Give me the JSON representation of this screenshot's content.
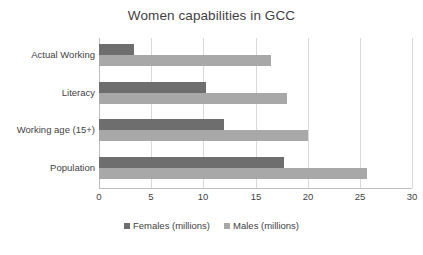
{
  "chart_data": {
    "type": "bar",
    "orientation": "horizontal",
    "title": "Women capabilities in GCC",
    "xlabel": "",
    "ylabel": "",
    "xlim": [
      0,
      30
    ],
    "xticks": [
      0,
      5,
      10,
      15,
      20,
      25,
      30
    ],
    "xtick_labels": [
      "0",
      "5",
      "10",
      "15",
      "20",
      "25",
      "30"
    ],
    "grid": true,
    "grid_axis": "x",
    "legend_position": "bottom",
    "categories": [
      "Actual Working",
      "Literacy",
      "Working age (15+)",
      "Population"
    ],
    "series": [
      {
        "name": "Females (millions)",
        "color": "#6e6e6e",
        "values": [
          3.4,
          10.3,
          12.0,
          17.7
        ]
      },
      {
        "name": "Males (millions)",
        "color": "#a8a8a8",
        "values": [
          16.5,
          18.0,
          20.0,
          25.7
        ]
      }
    ]
  },
  "colors": {
    "female_bar": "#6e6e6e",
    "male_bar": "#a8a8a8",
    "gridline": "#d9d9d9",
    "axis": "#bfbfbf",
    "text": "#3f3f3f",
    "background": "#ffffff"
  }
}
